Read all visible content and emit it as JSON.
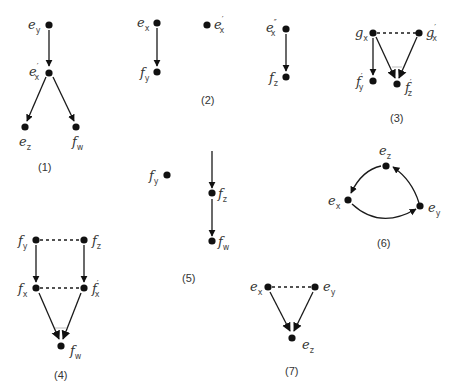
{
  "diagrams": [
    {
      "id": "1",
      "caption": "(1)",
      "nodes": [
        {
          "name": "e",
          "sub": "y",
          "prime": ""
        },
        {
          "name": "e",
          "sub": "x",
          "prime": "′"
        },
        {
          "name": "e",
          "sub": "z",
          "prime": ""
        },
        {
          "name": "f",
          "sub": "w",
          "prime": ""
        }
      ],
      "edges": [
        {
          "from": "e_y",
          "to": "e'_x",
          "type": "arrow"
        },
        {
          "from": "e'_x",
          "to": "e_z",
          "type": "arrow"
        },
        {
          "from": "e'_x",
          "to": "f_w",
          "type": "arrow"
        }
      ]
    },
    {
      "id": "2",
      "caption": "(2)",
      "nodes": [
        {
          "name": "e",
          "sub": "x",
          "prime": ""
        },
        {
          "name": "f",
          "sub": "y",
          "prime": ""
        },
        {
          "name": "e",
          "sub": "x",
          "prime": "′"
        },
        {
          "name": "e",
          "sub": "x",
          "prime": "″"
        },
        {
          "name": "f",
          "sub": "z",
          "prime": ""
        }
      ],
      "edges": [
        {
          "from": "e_x",
          "to": "f_y",
          "type": "arrow"
        },
        {
          "from": "e''_x",
          "to": "f_z",
          "type": "arrow"
        }
      ]
    },
    {
      "id": "3",
      "caption": "(3)",
      "nodes": [
        {
          "name": "g",
          "sub": "x",
          "prime": ""
        },
        {
          "name": "g",
          "sub": "x",
          "prime": "′"
        },
        {
          "name": "f",
          "sub": "y",
          "prime": "′"
        },
        {
          "name": "f",
          "sub": "z",
          "prime": "′"
        }
      ],
      "edges": [
        {
          "from": "g_x",
          "to": "g'_x",
          "type": "dashed"
        },
        {
          "from": "g_x",
          "to": "f'_y",
          "type": "arrow"
        },
        {
          "from": "g_x",
          "to": "f'_z",
          "type": "arrow"
        },
        {
          "from": "g'_x",
          "to": "f'_z",
          "type": "arrow"
        }
      ]
    },
    {
      "id": "4",
      "caption": "(4)",
      "nodes": [
        {
          "name": "f",
          "sub": "y",
          "prime": ""
        },
        {
          "name": "f",
          "sub": "z",
          "prime": ""
        },
        {
          "name": "f",
          "sub": "x",
          "prime": ""
        },
        {
          "name": "f",
          "sub": "x",
          "prime": "′"
        },
        {
          "name": "f",
          "sub": "w",
          "prime": ""
        }
      ],
      "edges": [
        {
          "from": "f_y",
          "to": "f_z",
          "type": "dashed"
        },
        {
          "from": "f_x",
          "to": "f'_x",
          "type": "dashed"
        },
        {
          "from": "f_y",
          "to": "f_x",
          "type": "arrow"
        },
        {
          "from": "f_z",
          "to": "f'_x",
          "type": "arrow"
        },
        {
          "from": "f_x",
          "to": "f_w",
          "type": "arrow"
        },
        {
          "from": "f'_x",
          "to": "f_w",
          "type": "arrow"
        }
      ]
    },
    {
      "id": "5",
      "caption": "(5)",
      "nodes": [
        {
          "name": "f",
          "sub": "y",
          "prime": ""
        },
        {
          "name": "f",
          "sub": "z",
          "prime": ""
        },
        {
          "name": "f",
          "sub": "w",
          "prime": ""
        }
      ],
      "edges": [
        {
          "from": "(incoming)",
          "to": "f_z",
          "type": "arrow"
        },
        {
          "from": "f_z",
          "to": "f_w",
          "type": "arrow"
        }
      ]
    },
    {
      "id": "6",
      "caption": "(6)",
      "nodes": [
        {
          "name": "e",
          "sub": "z",
          "prime": ""
        },
        {
          "name": "e",
          "sub": "x",
          "prime": ""
        },
        {
          "name": "e",
          "sub": "y",
          "prime": ""
        }
      ],
      "edges": [
        {
          "from": "e_z",
          "to": "e_x",
          "type": "curved-arrow"
        },
        {
          "from": "e_x",
          "to": "e_y",
          "type": "curved-arrow"
        },
        {
          "from": "e_y",
          "to": "e_z",
          "type": "curved-arrow"
        }
      ]
    },
    {
      "id": "7",
      "caption": "(7)",
      "nodes": [
        {
          "name": "e",
          "sub": "x",
          "prime": ""
        },
        {
          "name": "e",
          "sub": "y",
          "prime": ""
        },
        {
          "name": "e",
          "sub": "z",
          "prime": ""
        }
      ],
      "edges": [
        {
          "from": "e_x",
          "to": "e_y",
          "type": "dashed"
        },
        {
          "from": "e_x",
          "to": "e_z",
          "type": "arrow"
        },
        {
          "from": "e_y",
          "to": "e_z",
          "type": "arrow"
        }
      ]
    }
  ]
}
